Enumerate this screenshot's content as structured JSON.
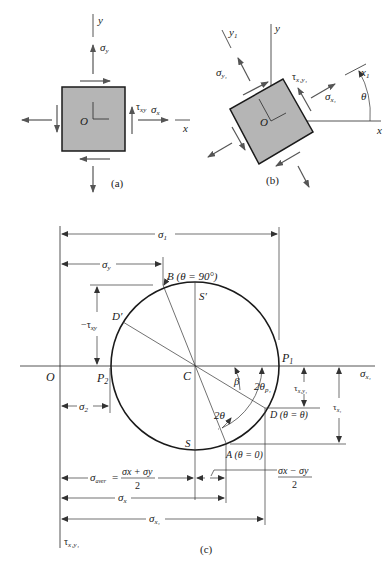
{
  "figure": {
    "panels": [
      {
        "id": "a",
        "caption": "(a)",
        "labels": {
          "y_axis": "y",
          "x_axis": "x",
          "origin": "O",
          "sigma_y": "σ",
          "sigma_y_sub": "y",
          "tau_xy": "τ",
          "tau_xy_sub": "xy",
          "sigma_x": "σ",
          "sigma_x_sub": "x"
        }
      },
      {
        "id": "b",
        "caption": "(b)",
        "labels": {
          "y_axis": "y",
          "x_axis": "x",
          "y1_axis": "y",
          "y1_sub": "1",
          "x1_axis": "x",
          "x1_sub": "1",
          "origin": "O",
          "theta": "θ",
          "sigma_y1": "σ",
          "sigma_y1_sub": "y₁",
          "tau_x1y1": "τ",
          "tau_x1y1_sub": "x₁y₁",
          "sigma_x1": "σ",
          "sigma_x1_sub": "x₁"
        }
      },
      {
        "id": "c",
        "caption": "(c)",
        "title": "Mohr's circle",
        "points": {
          "O": "O",
          "C": "C",
          "P1": "P",
          "P1_sub": "1",
          "P2": "P",
          "P2_sub": "2",
          "S": "S",
          "S_prime": "S′",
          "D_prime": "D′",
          "B": "B (θ = 90°)",
          "A": "A (θ = 0)",
          "D": "D (θ = θ)"
        },
        "angles": {
          "beta": "β",
          "two_theta": "2θ",
          "two_theta_p1": "2θ",
          "two_theta_p1_sub": "p₁"
        },
        "dimensions": {
          "sigma_1": "σ",
          "sigma_1_sub": "1",
          "sigma_y": "σ",
          "sigma_y_sub": "y",
          "neg_tau_xy": "−τ",
          "neg_tau_xy_sub": "xy",
          "sigma_2": "σ",
          "sigma_2_sub": "2",
          "sigma_aver": "σ",
          "sigma_aver_sub": "aver",
          "sigma_aver_eq": "=",
          "sigma_aver_num": "σx + σy",
          "sigma_aver_den": "2",
          "half_diff_num": "σx − σy",
          "half_diff_den": "2",
          "sigma_x": "σ",
          "sigma_x_sub": "x",
          "sigma_x1": "σ",
          "sigma_x1_sub": "x₁",
          "tau_x1y1": "τ",
          "tau_x1y1_sub": "x₁y₁",
          "tau_x1": "τ",
          "tau_x1_sub": "x₁"
        },
        "axes": {
          "horizontal": "σ",
          "horizontal_sub": "x₁",
          "vertical": "τ",
          "vertical_sub": "x₁y₁"
        }
      }
    ]
  }
}
